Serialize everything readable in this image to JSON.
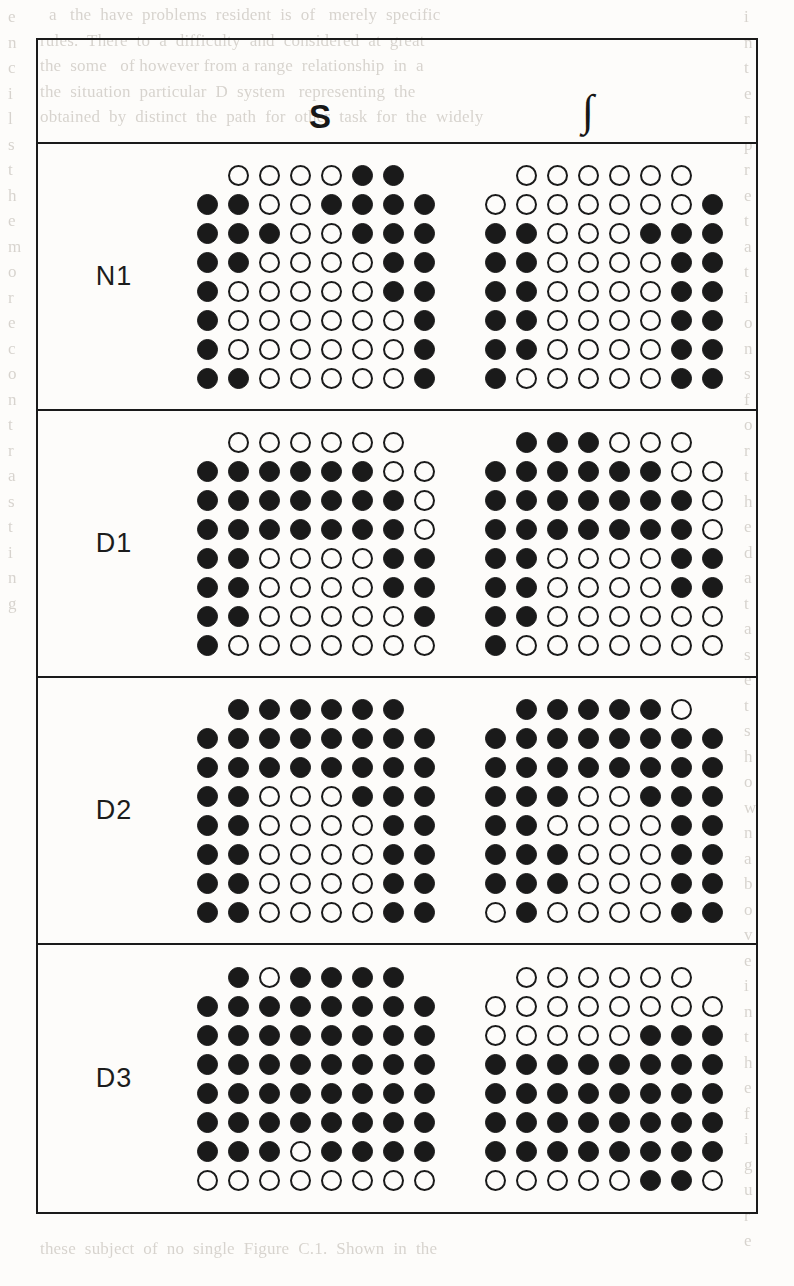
{
  "figure": {
    "columns": [
      {
        "id": "S",
        "label": "S"
      },
      {
        "id": "INT",
        "label": "∫"
      }
    ],
    "legend": {
      "filled_symbol": "filled-circle",
      "open_symbol": "open-circle"
    },
    "rows": [
      {
        "label": "N1",
        "grids": [
          {
            "column": "S",
            "cells": [
              [
                "none",
                "open",
                "open",
                "open",
                "open",
                "filled",
                "filled",
                "none"
              ],
              [
                "filled",
                "filled",
                "open",
                "open",
                "filled",
                "filled",
                "filled",
                "filled"
              ],
              [
                "filled",
                "filled",
                "filled",
                "open",
                "open",
                "filled",
                "filled",
                "filled"
              ],
              [
                "filled",
                "filled",
                "open",
                "open",
                "open",
                "open",
                "filled",
                "filled"
              ],
              [
                "filled",
                "open",
                "open",
                "open",
                "open",
                "open",
                "filled",
                "filled"
              ],
              [
                "filled",
                "open",
                "open",
                "open",
                "open",
                "open",
                "open",
                "filled"
              ],
              [
                "filled",
                "open",
                "open",
                "open",
                "open",
                "open",
                "open",
                "filled"
              ],
              [
                "filled",
                "filled",
                "open",
                "open",
                "open",
                "open",
                "open",
                "filled"
              ]
            ]
          },
          {
            "column": "INT",
            "cells": [
              [
                "none",
                "open",
                "open",
                "open",
                "open",
                "open",
                "open",
                "none"
              ],
              [
                "open",
                "open",
                "open",
                "open",
                "open",
                "open",
                "open",
                "filled"
              ],
              [
                "filled",
                "filled",
                "open",
                "open",
                "open",
                "filled",
                "filled",
                "filled"
              ],
              [
                "filled",
                "filled",
                "open",
                "open",
                "open",
                "open",
                "filled",
                "filled"
              ],
              [
                "filled",
                "filled",
                "open",
                "open",
                "open",
                "open",
                "filled",
                "filled"
              ],
              [
                "filled",
                "filled",
                "open",
                "open",
                "open",
                "open",
                "filled",
                "filled"
              ],
              [
                "filled",
                "filled",
                "open",
                "open",
                "open",
                "open",
                "filled",
                "filled"
              ],
              [
                "filled",
                "open",
                "open",
                "open",
                "open",
                "open",
                "filled",
                "filled"
              ]
            ]
          }
        ]
      },
      {
        "label": "D1",
        "grids": [
          {
            "column": "S",
            "cells": [
              [
                "none",
                "open",
                "open",
                "open",
                "open",
                "open",
                "open",
                "none"
              ],
              [
                "filled",
                "filled",
                "filled",
                "filled",
                "filled",
                "filled",
                "open",
                "open"
              ],
              [
                "filled",
                "filled",
                "filled",
                "filled",
                "filled",
                "filled",
                "filled",
                "open"
              ],
              [
                "filled",
                "filled",
                "filled",
                "filled",
                "filled",
                "filled",
                "filled",
                "open"
              ],
              [
                "filled",
                "filled",
                "open",
                "open",
                "open",
                "open",
                "filled",
                "filled"
              ],
              [
                "filled",
                "filled",
                "open",
                "open",
                "open",
                "open",
                "filled",
                "filled"
              ],
              [
                "filled",
                "filled",
                "open",
                "open",
                "open",
                "open",
                "open",
                "filled"
              ],
              [
                "filled",
                "open",
                "open",
                "open",
                "open",
                "open",
                "open",
                "open"
              ]
            ]
          },
          {
            "column": "INT",
            "cells": [
              [
                "none",
                "filled",
                "filled",
                "filled",
                "open",
                "open",
                "open",
                "none"
              ],
              [
                "filled",
                "filled",
                "filled",
                "filled",
                "filled",
                "filled",
                "open",
                "open"
              ],
              [
                "filled",
                "filled",
                "filled",
                "filled",
                "filled",
                "filled",
                "filled",
                "open"
              ],
              [
                "filled",
                "filled",
                "filled",
                "filled",
                "filled",
                "filled",
                "filled",
                "open"
              ],
              [
                "filled",
                "filled",
                "open",
                "open",
                "open",
                "open",
                "filled",
                "filled"
              ],
              [
                "filled",
                "filled",
                "open",
                "open",
                "open",
                "open",
                "filled",
                "filled"
              ],
              [
                "filled",
                "filled",
                "open",
                "open",
                "open",
                "open",
                "open",
                "open"
              ],
              [
                "filled",
                "open",
                "open",
                "open",
                "open",
                "open",
                "open",
                "open"
              ]
            ]
          }
        ]
      },
      {
        "label": "D2",
        "grids": [
          {
            "column": "S",
            "cells": [
              [
                "none",
                "filled",
                "filled",
                "filled",
                "filled",
                "filled",
                "filled",
                "none"
              ],
              [
                "filled",
                "filled",
                "filled",
                "filled",
                "filled",
                "filled",
                "filled",
                "filled"
              ],
              [
                "filled",
                "filled",
                "filled",
                "filled",
                "filled",
                "filled",
                "filled",
                "filled"
              ],
              [
                "filled",
                "filled",
                "open",
                "open",
                "open",
                "filled",
                "filled",
                "filled"
              ],
              [
                "filled",
                "filled",
                "open",
                "open",
                "open",
                "open",
                "filled",
                "filled"
              ],
              [
                "filled",
                "filled",
                "open",
                "open",
                "open",
                "open",
                "filled",
                "filled"
              ],
              [
                "filled",
                "filled",
                "open",
                "open",
                "open",
                "open",
                "filled",
                "filled"
              ],
              [
                "filled",
                "filled",
                "open",
                "open",
                "open",
                "open",
                "filled",
                "filled"
              ]
            ]
          },
          {
            "column": "INT",
            "cells": [
              [
                "none",
                "filled",
                "filled",
                "filled",
                "filled",
                "filled",
                "open",
                "none"
              ],
              [
                "filled",
                "filled",
                "filled",
                "filled",
                "filled",
                "filled",
                "filled",
                "filled"
              ],
              [
                "filled",
                "filled",
                "filled",
                "filled",
                "filled",
                "filled",
                "filled",
                "filled"
              ],
              [
                "filled",
                "filled",
                "filled",
                "open",
                "open",
                "filled",
                "filled",
                "filled"
              ],
              [
                "filled",
                "filled",
                "open",
                "open",
                "open",
                "open",
                "filled",
                "filled"
              ],
              [
                "filled",
                "filled",
                "filled",
                "open",
                "open",
                "open",
                "filled",
                "filled"
              ],
              [
                "filled",
                "filled",
                "filled",
                "open",
                "open",
                "open",
                "filled",
                "filled"
              ],
              [
                "open",
                "filled",
                "open",
                "open",
                "open",
                "open",
                "filled",
                "filled"
              ]
            ]
          }
        ]
      },
      {
        "label": "D3",
        "grids": [
          {
            "column": "S",
            "cells": [
              [
                "none",
                "filled",
                "open",
                "filled",
                "filled",
                "filled",
                "filled",
                "none"
              ],
              [
                "filled",
                "filled",
                "filled",
                "filled",
                "filled",
                "filled",
                "filled",
                "filled"
              ],
              [
                "filled",
                "filled",
                "filled",
                "filled",
                "filled",
                "filled",
                "filled",
                "filled"
              ],
              [
                "filled",
                "filled",
                "filled",
                "filled",
                "filled",
                "filled",
                "filled",
                "filled"
              ],
              [
                "filled",
                "filled",
                "filled",
                "filled",
                "filled",
                "filled",
                "filled",
                "filled"
              ],
              [
                "filled",
                "filled",
                "filled",
                "filled",
                "filled",
                "filled",
                "filled",
                "filled"
              ],
              [
                "filled",
                "filled",
                "filled",
                "open",
                "filled",
                "filled",
                "filled",
                "filled"
              ],
              [
                "open",
                "open",
                "open",
                "open",
                "open",
                "open",
                "open",
                "open"
              ]
            ]
          },
          {
            "column": "INT",
            "cells": [
              [
                "none",
                "open",
                "open",
                "open",
                "open",
                "open",
                "open",
                "none"
              ],
              [
                "open",
                "open",
                "open",
                "open",
                "open",
                "open",
                "open",
                "open"
              ],
              [
                "open",
                "open",
                "open",
                "open",
                "open",
                "filled",
                "filled",
                "filled"
              ],
              [
                "filled",
                "filled",
                "filled",
                "filled",
                "filled",
                "filled",
                "filled",
                "filled"
              ],
              [
                "filled",
                "filled",
                "filled",
                "filled",
                "filled",
                "filled",
                "filled",
                "filled"
              ],
              [
                "filled",
                "filled",
                "filled",
                "filled",
                "filled",
                "filled",
                "filled",
                "filled"
              ],
              [
                "filled",
                "filled",
                "filled",
                "filled",
                "filled",
                "filled",
                "filled",
                "filled"
              ],
              [
                "open",
                "open",
                "open",
                "open",
                "open",
                "filled",
                "filled",
                "open"
              ]
            ]
          }
        ]
      }
    ]
  },
  "background_text": {
    "top": "  a   the  have  problems  resident  is  of   merely  specific\nrules.  There  to  a  difficulty  and  considered  at  great\nthe  some   of however from a range  relationship  in  a\nthe  situation  particular  D  system   representing  the\nobtained  by  distinct  the  path  for  other  task  for  the  widely",
    "left": "e\nn\nc\ni\nl\ns\nt\nh\ne\nm\no\nr\ne\nc\no\nn\nt\nr\na\ns\nt\ni\nn\ng",
    "right": "i\nn\nt\ne\nr\np\nr\ne\nt\na\nt\ni\no\nn\ns\nf\no\nr\nt\nh\ne\nd\na\nt\na\ns\ne\nt\ns\nh\no\nw\nn\na\nb\no\nv\ne\ni\nn\nt\nh\ne\nf\ni\ng\nu\nr\ne",
    "bottom": "these  subject  of  no  single  Figure  C.1.  Shown  in  the"
  }
}
